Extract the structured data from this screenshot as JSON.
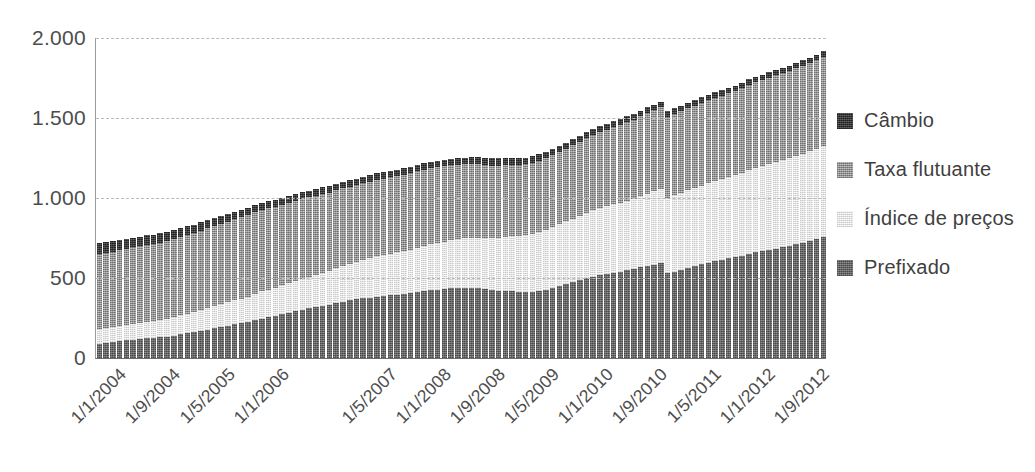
{
  "chart_data": {
    "type": "bar",
    "stacked": true,
    "title": "",
    "xlabel": "",
    "ylabel": "",
    "ylim": [
      0,
      2000
    ],
    "yticks": [
      0,
      500,
      1000,
      1500,
      2000
    ],
    "ytick_labels": [
      "0",
      "500",
      "1.000",
      "1.500",
      "2.000"
    ],
    "grid": true,
    "legend_position": "right",
    "legend": [
      "Câmbio",
      "Taxa flutuante",
      "Índice de preços",
      "Prefixado"
    ],
    "stack_order_bottom_to_top": [
      "Prefixado",
      "Índice de preços",
      "Taxa flutuante",
      "Câmbio"
    ],
    "colors": {
      "Câmbio": "#3c3c3c",
      "Taxa flutuante": "#9a9a9a",
      "Índice de preços": "#ececec",
      "Prefixado": "#6b6b6b"
    },
    "xtick_labels": [
      "1/1/2004",
      "1/9/2004",
      "1/5/2005",
      "1/1/2006",
      "1/5/2007",
      "1/1/2008",
      "1/9/2008",
      "1/5/2009",
      "1/1/2010",
      "1/9/2010",
      "1/5/2011",
      "1/1/2012",
      "1/9/2012"
    ],
    "xtick_indices": [
      0,
      8,
      16,
      24,
      40,
      48,
      56,
      64,
      72,
      80,
      88,
      96,
      104
    ],
    "categories": [
      "1/1/2004",
      "1/2/2004",
      "1/3/2004",
      "1/4/2004",
      "1/5/2004",
      "1/6/2004",
      "1/7/2004",
      "1/8/2004",
      "1/9/2004",
      "1/10/2004",
      "1/11/2004",
      "1/12/2004",
      "1/1/2005",
      "1/2/2005",
      "1/3/2005",
      "1/4/2005",
      "1/5/2005",
      "1/6/2005",
      "1/7/2005",
      "1/8/2005",
      "1/9/2005",
      "1/10/2005",
      "1/11/2005",
      "1/12/2005",
      "1/1/2006",
      "1/2/2006",
      "1/3/2006",
      "1/4/2006",
      "1/5/2006",
      "1/6/2006",
      "1/7/2006",
      "1/8/2006",
      "1/9/2006",
      "1/10/2006",
      "1/11/2006",
      "1/12/2006",
      "1/1/2007",
      "1/2/2007",
      "1/3/2007",
      "1/4/2007",
      "1/5/2007",
      "1/6/2007",
      "1/7/2007",
      "1/8/2007",
      "1/9/2007",
      "1/10/2007",
      "1/11/2007",
      "1/12/2007",
      "1/1/2008",
      "1/2/2008",
      "1/3/2008",
      "1/4/2008",
      "1/5/2008",
      "1/6/2008",
      "1/7/2008",
      "1/8/2008",
      "1/9/2008",
      "1/10/2008",
      "1/11/2008",
      "1/12/2008",
      "1/1/2009",
      "1/2/2009",
      "1/3/2009",
      "1/4/2009",
      "1/5/2009",
      "1/6/2009",
      "1/7/2009",
      "1/8/2009",
      "1/9/2009",
      "1/10/2009",
      "1/11/2009",
      "1/12/2009",
      "1/1/2010",
      "1/2/2010",
      "1/3/2010",
      "1/4/2010",
      "1/5/2010",
      "1/6/2010",
      "1/7/2010",
      "1/8/2010",
      "1/9/2010",
      "1/10/2010",
      "1/11/2010",
      "1/12/2010",
      "1/1/2011",
      "1/2/2011",
      "1/3/2011",
      "1/4/2011",
      "1/5/2011",
      "1/6/2011",
      "1/7/2011",
      "1/8/2011",
      "1/9/2011",
      "1/10/2011",
      "1/11/2011",
      "1/12/2011",
      "1/1/2012",
      "1/2/2012",
      "1/3/2012",
      "1/4/2012",
      "1/5/2012",
      "1/6/2012",
      "1/7/2012",
      "1/8/2012",
      "1/9/2012",
      "1/10/2012",
      "1/11/2012",
      "1/12/2012"
    ],
    "series": [
      {
        "name": "Prefixado",
        "values": [
          90,
          95,
          100,
          105,
          110,
          115,
          118,
          122,
          126,
          130,
          134,
          140,
          148,
          155,
          162,
          170,
          178,
          186,
          194,
          202,
          210,
          218,
          226,
          236,
          246,
          254,
          262,
          272,
          282,
          292,
          300,
          310,
          318,
          326,
          334,
          344,
          352,
          360,
          366,
          372,
          378,
          384,
          388,
          392,
          396,
          400,
          404,
          410,
          418,
          424,
          428,
          432,
          436,
          438,
          440,
          440,
          436,
          430,
          424,
          420,
          418,
          416,
          414,
          412,
          414,
          420,
          428,
          438,
          450,
          462,
          474,
          486,
          498,
          508,
          516,
          524,
          532,
          540,
          548,
          556,
          566,
          576,
          584,
          592,
          530,
          540,
          552,
          564,
          576,
          586,
          596,
          606,
          614,
          622,
          630,
          640,
          650,
          660,
          668,
          676,
          684,
          692,
          700,
          710,
          720,
          732,
          744,
          756
        ]
      },
      {
        "name": "Índice de preços",
        "values": [
          90,
          92,
          94,
          96,
          98,
          100,
          102,
          104,
          106,
          108,
          110,
          114,
          118,
          122,
          126,
          130,
          134,
          138,
          142,
          146,
          150,
          154,
          158,
          164,
          170,
          174,
          178,
          182,
          186,
          190,
          194,
          198,
          202,
          206,
          210,
          216,
          222,
          228,
          234,
          240,
          246,
          252,
          256,
          260,
          264,
          268,
          272,
          278,
          284,
          288,
          292,
          296,
          300,
          304,
          308,
          312,
          316,
          320,
          326,
          332,
          338,
          344,
          350,
          356,
          362,
          368,
          374,
          380,
          386,
          392,
          398,
          404,
          410,
          416,
          420,
          424,
          428,
          432,
          436,
          440,
          446,
          452,
          458,
          464,
          470,
          476,
          480,
          484,
          488,
          492,
          496,
          500,
          504,
          508,
          512,
          518,
          524,
          528,
          532,
          536,
          540,
          544,
          548,
          552,
          556,
          560,
          564,
          570
        ]
      },
      {
        "name": "Taxa flutuante",
        "values": [
          470,
          468,
          470,
          472,
          474,
          476,
          478,
          480,
          482,
          484,
          486,
          488,
          490,
          492,
          494,
          496,
          498,
          500,
          502,
          504,
          506,
          508,
          510,
          512,
          510,
          508,
          506,
          504,
          502,
          500,
          498,
          496,
          494,
          492,
          490,
          488,
          486,
          484,
          482,
          480,
          478,
          478,
          478,
          478,
          478,
          478,
          478,
          478,
          476,
          474,
          472,
          470,
          468,
          466,
          464,
          462,
          458,
          454,
          452,
          450,
          448,
          446,
          444,
          442,
          442,
          444,
          446,
          448,
          450,
          454,
          458,
          462,
          466,
          470,
          474,
          478,
          482,
          486,
          490,
          494,
          498,
          502,
          506,
          510,
          506,
          508,
          510,
          512,
          514,
          516,
          518,
          520,
          522,
          524,
          526,
          530,
          534,
          536,
          538,
          540,
          542,
          544,
          546,
          548,
          550,
          552,
          554,
          556
        ]
      },
      {
        "name": "Câmbio",
        "values": [
          70,
          68,
          66,
          64,
          62,
          62,
          60,
          60,
          58,
          58,
          56,
          56,
          54,
          54,
          52,
          52,
          50,
          50,
          50,
          48,
          48,
          48,
          46,
          46,
          46,
          46,
          44,
          44,
          44,
          44,
          44,
          42,
          42,
          42,
          42,
          42,
          42,
          42,
          40,
          40,
          40,
          40,
          40,
          40,
          40,
          40,
          40,
          40,
          40,
          40,
          40,
          40,
          40,
          40,
          40,
          42,
          44,
          46,
          46,
          46,
          46,
          44,
          44,
          42,
          42,
          42,
          40,
          40,
          40,
          38,
          38,
          38,
          38,
          38,
          38,
          38,
          38,
          38,
          38,
          36,
          36,
          36,
          36,
          36,
          36,
          36,
          36,
          36,
          36,
          36,
          36,
          34,
          34,
          34,
          34,
          34,
          34,
          34,
          34,
          34,
          34,
          34,
          34,
          34,
          34,
          34,
          34,
          34
        ]
      }
    ]
  },
  "legend": {
    "items": [
      {
        "label": "Câmbio",
        "key": "Câmbio"
      },
      {
        "label": "Taxa flutuante",
        "key": "Taxa flutuante"
      },
      {
        "label": "Índice de preços",
        "key": "Índice de preços"
      },
      {
        "label": "Prefixado",
        "key": "Prefixado"
      }
    ]
  }
}
